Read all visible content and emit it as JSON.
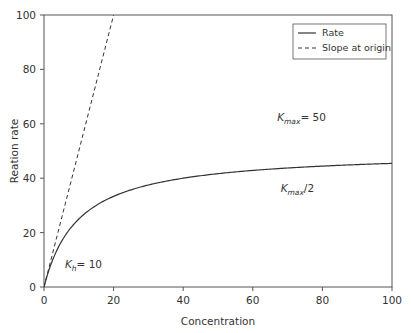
{
  "chart_data": {
    "type": "line",
    "title": "",
    "xlabel": "Concentration",
    "ylabel": "Reation rate",
    "xlim": [
      0,
      100
    ],
    "ylim": [
      0,
      100
    ],
    "x_ticks": [
      0,
      20,
      40,
      60,
      80,
      100
    ],
    "y_ticks": [
      0,
      20,
      40,
      60,
      80,
      100
    ],
    "grid": false,
    "legend_position": "upper right",
    "series": [
      {
        "name": "Rate",
        "style": "solid",
        "function": "y = 50*x/(10+x)",
        "x": [
          0,
          2,
          5,
          10,
          15,
          20,
          30,
          40,
          50,
          60,
          70,
          80,
          90,
          100
        ],
        "values": [
          0,
          8.33,
          16.67,
          25,
          30,
          33.33,
          37.5,
          40,
          41.67,
          42.86,
          43.75,
          44.44,
          45,
          45.45
        ]
      },
      {
        "name": "Slope at origin",
        "style": "dashed",
        "function": "y = 5*x",
        "x": [
          0,
          20
        ],
        "values": [
          0,
          100
        ]
      }
    ],
    "annotations": [
      {
        "base": "K",
        "sub": "max",
        "suffix": "= 50",
        "x": 67,
        "y": 61
      },
      {
        "base": "K",
        "sub": "max",
        "suffix": "/2",
        "x": 68,
        "y": 35
      },
      {
        "base": "K",
        "sub": "h",
        "suffix": "= 10",
        "x": 6,
        "y": 7
      }
    ]
  },
  "legend": {
    "items": [
      {
        "label": "Rate",
        "style": "solid"
      },
      {
        "label": "Slope at origin",
        "style": "dashed"
      }
    ]
  },
  "colors": {
    "line": "#333333",
    "axis": "#555555"
  }
}
